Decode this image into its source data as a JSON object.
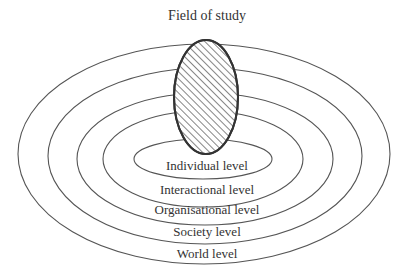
{
  "diagram": {
    "title": "Field of study",
    "field": {
      "label": "Field of study",
      "fill": "hatched"
    },
    "levels": [
      {
        "label": "Individual level"
      },
      {
        "label": "Interactional level"
      },
      {
        "label": "Organisational level"
      },
      {
        "label": "Society level"
      },
      {
        "label": "World level"
      }
    ]
  },
  "colors": {
    "stroke": "#555555",
    "text": "#333333",
    "background": "#ffffff"
  }
}
